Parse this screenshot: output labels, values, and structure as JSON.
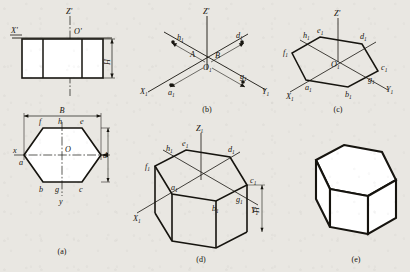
{
  "figure": {
    "background_color": "#e9e7e2",
    "ink_color": "#16140f",
    "panels": [
      {
        "key": "a",
        "caption": "(a)",
        "description": "Orthographic two-view drawing: front view rectangle with height H and width B, top view regular hexagon with vertices a,b,c,d,e,f and midpoints g,h",
        "axes": [
          "X'",
          "Z'",
          "O'",
          "x",
          "y",
          "O"
        ],
        "dimensions": [
          "H",
          "B"
        ],
        "vertices": [
          "a",
          "b",
          "c",
          "d",
          "e",
          "f",
          "g",
          "h"
        ]
      },
      {
        "key": "b",
        "caption": "(b)",
        "description": "Isometric axes X1, Y1, Z' with offsets A and B laying out points a1, g1, h1, d1",
        "axes": [
          "Z'",
          "X1",
          "Y1",
          "O1"
        ],
        "dimensions": [
          "A",
          "B"
        ],
        "points": [
          "h1",
          "d1",
          "a1",
          "g1"
        ]
      },
      {
        "key": "c",
        "caption": "(c)",
        "description": "Isometric hexagon base constructed through points a1..h1",
        "axes": [
          "Z'",
          "X1",
          "Y1",
          "O1"
        ],
        "points": [
          "e1",
          "h1",
          "d1",
          "f1",
          "c1",
          "a1",
          "g1",
          "b1"
        ]
      },
      {
        "key": "d",
        "caption": "(d)",
        "description": "Prism extruded downward by height H from the isometric hexagon",
        "axes": [
          "Z1",
          "X1",
          "Y1"
        ],
        "dimensions": [
          "H"
        ],
        "points": [
          "e1",
          "h1",
          "d1",
          "f1",
          "c1",
          "a1",
          "g1",
          "b1"
        ]
      },
      {
        "key": "e",
        "caption": "(e)",
        "description": "Finished hexagonal prism with construction lines removed"
      }
    ],
    "labels": {
      "x_prime": "X'",
      "z_prime": "Z'",
      "o_prime": "O'",
      "z1": "Z1",
      "x1": "X1",
      "y1": "Y1",
      "o1": "O1",
      "x_lower": "x",
      "y_lower": "y",
      "o_center": "O",
      "dim_H": "H",
      "dim_B": "B",
      "dim_A": "A",
      "dim_B2": "B",
      "a": "a",
      "b": "b",
      "c": "c",
      "d": "d",
      "e": "e",
      "f": "f",
      "g": "g",
      "h": "h",
      "a1": "a",
      "b1": "b",
      "c1": "c",
      "d1": "d",
      "e1": "e",
      "f1": "f",
      "g1": "g",
      "h1": "h",
      "sub1": "1",
      "cap_a": "(a)",
      "cap_b": "(b)",
      "cap_c": "(c)",
      "cap_d": "(d)",
      "cap_e": "(e)"
    }
  }
}
